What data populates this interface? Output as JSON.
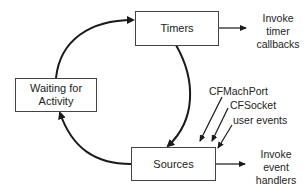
{
  "nodes": {
    "timers": "Timers",
    "waiting": "Waiting for Activity",
    "sources": "Sources"
  },
  "labels": {
    "timer_output": [
      "Invoke",
      "timer",
      "callbacks"
    ],
    "source_output": [
      "Invoke",
      "event",
      "handlers"
    ],
    "inputs": [
      "CFMachPort",
      "CFSocket",
      "user events"
    ]
  },
  "colors": {
    "stroke": "#1a1a1a",
    "box_border": "#444444"
  }
}
